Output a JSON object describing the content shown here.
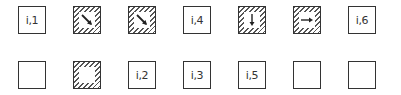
{
  "diagram": {
    "rows": [
      {
        "cells": [
          {
            "type": "label",
            "text": "i,1"
          },
          {
            "type": "hatched-arrow",
            "arrow": "diagonal-down-right"
          },
          {
            "type": "hatched-arrow",
            "arrow": "diagonal-down-right"
          },
          {
            "type": "label",
            "text": "i,4"
          },
          {
            "type": "hatched-arrow",
            "arrow": "down"
          },
          {
            "type": "hatched-arrow",
            "arrow": "right"
          },
          {
            "type": "label",
            "text": "i,6"
          }
        ]
      },
      {
        "cells": [
          {
            "type": "empty"
          },
          {
            "type": "hatched-empty"
          },
          {
            "type": "label",
            "text": "i,2"
          },
          {
            "type": "label",
            "text": "i,3"
          },
          {
            "type": "label",
            "text": "i,5"
          },
          {
            "type": "empty"
          },
          {
            "type": "empty"
          }
        ]
      }
    ],
    "colors": {
      "stroke": "#333333",
      "hatch": "#555555",
      "background": "#ffffff"
    }
  }
}
